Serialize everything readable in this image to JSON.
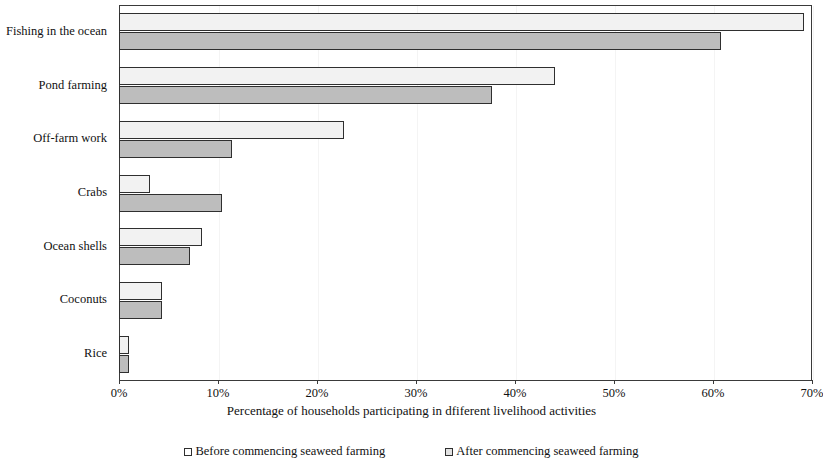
{
  "chart_data": {
    "type": "bar",
    "orientation": "horizontal",
    "title": "",
    "xlabel": "Percentage of households participating in dfiferent livelihood activities",
    "ylabel": "",
    "xlim": [
      0,
      70
    ],
    "xticks": [
      "0%",
      "10%",
      "20%",
      "30%",
      "40%",
      "50%",
      "60%",
      "70%"
    ],
    "xtick_values": [
      0,
      10,
      20,
      30,
      40,
      50,
      60,
      70
    ],
    "grid": true,
    "legend_position": "bottom",
    "categories": [
      "Fishing in the ocean",
      "Pond farming",
      "Off-farm work",
      "Crabs",
      "Ocean shells",
      "Coconuts",
      "Rice"
    ],
    "series": [
      {
        "name": "Before commencing seaweed farming",
        "color": "#f2f2f2",
        "values": [
          69.2,
          44.0,
          22.7,
          3.1,
          8.4,
          4.3,
          1.0
        ]
      },
      {
        "name": "After commencing seaweed farming",
        "color": "#bdbdbd",
        "values": [
          60.8,
          37.7,
          11.4,
          10.4,
          7.2,
          4.3,
          1.0
        ]
      }
    ]
  },
  "legend": {
    "items": [
      {
        "label": "Before commencing seaweed farming",
        "swatch": "legend-swatch-before"
      },
      {
        "label": "After commencing seaweed farming",
        "swatch": "legend-swatch-after"
      }
    ]
  },
  "colors": {
    "before_fill": "#f2f2f2",
    "after_fill": "#bdbdbd",
    "bar_outline": "#2f2f2f",
    "axis": "#3a3a3a",
    "gridline": "#f4f4f4",
    "background": "#ffffff"
  }
}
